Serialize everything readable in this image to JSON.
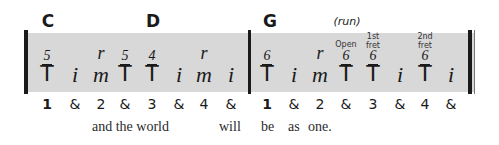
{
  "chords": [
    {
      "label": "C",
      "x": 48
    },
    {
      "label": "D",
      "x": 153
    },
    {
      "label": "G",
      "x": 270
    }
  ],
  "run_label": {
    "text": "(run)",
    "x": 347
  },
  "measures": [
    {
      "notes": [
        {
          "finger": "T",
          "fret": "5",
          "x": 47
        },
        {
          "finger": "i",
          "x": 75
        },
        {
          "finger": "m",
          "mark": "r",
          "x": 101
        },
        {
          "finger": "T",
          "fret": "5",
          "x": 125
        },
        {
          "finger": "T",
          "fret": "4",
          "x": 152
        },
        {
          "finger": "i",
          "x": 179
        },
        {
          "finger": "m",
          "mark": "r",
          "x": 204
        },
        {
          "finger": "i",
          "x": 231
        }
      ]
    },
    {
      "notes": [
        {
          "finger": "T",
          "fret": "6",
          "x": 267
        },
        {
          "finger": "i",
          "x": 294
        },
        {
          "finger": "m",
          "mark": "r",
          "x": 320
        },
        {
          "finger": "T",
          "fret": "6",
          "annotation": "Open",
          "x": 346
        },
        {
          "finger": "T",
          "fret": "6",
          "annotation": "1st\nfret",
          "x": 373
        },
        {
          "finger": "i",
          "x": 400
        },
        {
          "finger": "T",
          "fret": "6",
          "annotation": "2nd\nfret",
          "x": 425
        },
        {
          "finger": "i",
          "x": 451
        }
      ]
    }
  ],
  "counts": {
    "measure1": [
      "1",
      "&",
      "2",
      "&",
      "3",
      "&",
      "4",
      "&"
    ],
    "measure2": [
      "1",
      "&",
      "2",
      "&",
      "3",
      "&",
      "4",
      "&"
    ]
  },
  "lyrics": [
    {
      "text": "and the world",
      "x": 92
    },
    {
      "text": "will",
      "x": 219
    },
    {
      "text": "be",
      "x": 261
    },
    {
      "text": "as",
      "x": 288
    },
    {
      "text": "one.",
      "x": 308
    }
  ],
  "colors": {
    "staff_shade": "#d8d8d8",
    "ink": "#1a1a1a"
  }
}
